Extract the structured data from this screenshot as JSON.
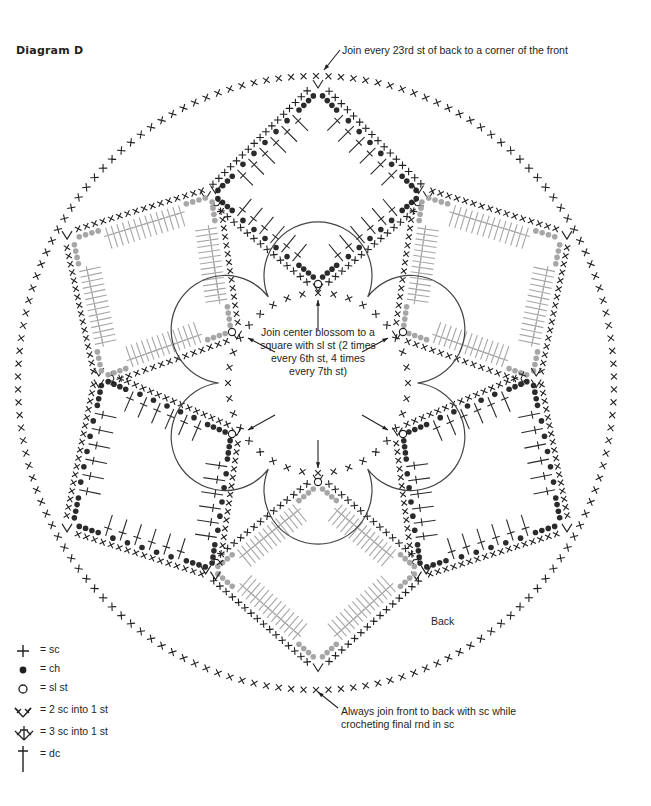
{
  "header": {
    "title": "Diagram D"
  },
  "annotations": {
    "top_note": "Join every 23rd st of back to a corner of the front",
    "center_note": "Join center blossom to a square with sl st (2 times every 6th st, 4 times every 7th st)",
    "back_label": "Back",
    "bottom_note": "Always join front to back with sc while crocheting final rnd in sc"
  },
  "legend": {
    "items": [
      {
        "icon": "sc-cross-icon",
        "label": "= sc"
      },
      {
        "icon": "ch-dot-icon",
        "label": "= ch"
      },
      {
        "icon": "sl-st-circle-icon",
        "label": "= sl st"
      },
      {
        "icon": "two-sc-into-one-icon",
        "label": "= 2 sc into 1 st"
      },
      {
        "icon": "three-sc-into-one-icon",
        "label": "= 3 sc into 1 st"
      },
      {
        "icon": "dc-icon",
        "label": "= dc"
      }
    ]
  },
  "colors": {
    "ink": "#231f20",
    "dark_square": "#2b2b2b",
    "grey_square": "#a6a6a6",
    "background": "#ffffff"
  },
  "layout": {
    "outer_ring": {
      "cx": 316,
      "cy": 383,
      "rx": 298,
      "ry": 307,
      "stitch": "sc"
    },
    "blossom": {
      "cx": 318,
      "cy": 383,
      "inner_radius": 90,
      "petals": 6
    },
    "squares": [
      {
        "name": "top",
        "shade": "dark",
        "corners": [
          [
            318,
            90
          ],
          [
            422,
            195
          ],
          [
            318,
            282
          ],
          [
            212,
            195
          ]
        ]
      },
      {
        "name": "upper-right",
        "shade": "grey",
        "corners": [
          [
            422,
            195
          ],
          [
            562,
            238
          ],
          [
            533,
            378
          ],
          [
            402,
            332
          ]
        ]
      },
      {
        "name": "lower-right",
        "shade": "dark",
        "corners": [
          [
            533,
            378
          ],
          [
            562,
            525
          ],
          [
            420,
            570
          ],
          [
            402,
            434
          ]
        ]
      },
      {
        "name": "bottom",
        "shade": "grey",
        "corners": [
          [
            318,
            484
          ],
          [
            420,
            570
          ],
          [
            318,
            662
          ],
          [
            212,
            570
          ]
        ]
      },
      {
        "name": "lower-left",
        "shade": "dark",
        "corners": [
          [
            102,
            378
          ],
          [
            232,
            434
          ],
          [
            212,
            570
          ],
          [
            72,
            525
          ]
        ]
      },
      {
        "name": "upper-left",
        "shade": "grey",
        "corners": [
          [
            72,
            238
          ],
          [
            212,
            195
          ],
          [
            232,
            332
          ],
          [
            102,
            378
          ]
        ]
      }
    ]
  }
}
